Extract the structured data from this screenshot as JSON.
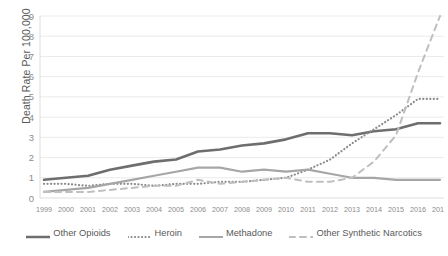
{
  "chart_data": {
    "type": "line",
    "title": "",
    "xlabel": "",
    "ylabel": "Death Rate Per 100,000",
    "ylim": [
      0,
      9
    ],
    "yticks": [
      0,
      1,
      2,
      3,
      4,
      5,
      6,
      7,
      8,
      9
    ],
    "grid": true,
    "legend_position": "bottom",
    "categories": [
      "1999",
      "2000",
      "2001",
      "2002",
      "2003",
      "2004",
      "2005",
      "2006",
      "2007",
      "2008",
      "2009",
      "2010",
      "2011",
      "2012",
      "2013",
      "2014",
      "2015",
      "2016",
      "2017"
    ],
    "series": [
      {
        "name": "Other Opioids",
        "style": "solid",
        "color": "#6e6e6e",
        "width": 2.6,
        "values": [
          0.9,
          1.0,
          1.1,
          1.4,
          1.6,
          1.8,
          1.9,
          2.3,
          2.4,
          2.6,
          2.7,
          2.9,
          3.2,
          3.2,
          3.1,
          3.3,
          3.4,
          3.7,
          3.7
        ]
      },
      {
        "name": "Heroin",
        "style": "dotted",
        "color": "#8c8c8c",
        "width": 2.2,
        "values": [
          0.7,
          0.7,
          0.6,
          0.7,
          0.7,
          0.6,
          0.7,
          0.7,
          0.8,
          0.8,
          0.9,
          1.0,
          1.4,
          1.9,
          2.7,
          3.4,
          4.1,
          4.9,
          4.9
        ]
      },
      {
        "name": "Methadone",
        "style": "solid",
        "color": "#a6a6a6",
        "width": 2.2,
        "values": [
          0.3,
          0.4,
          0.5,
          0.7,
          0.9,
          1.1,
          1.3,
          1.5,
          1.5,
          1.3,
          1.4,
          1.3,
          1.4,
          1.2,
          1.0,
          1.0,
          0.9,
          0.9,
          0.9
        ]
      },
      {
        "name": "Other Synthetic Narcotics",
        "style": "dashed",
        "color": "#bfbfbf",
        "width": 2.0,
        "values": [
          0.3,
          0.3,
          0.3,
          0.4,
          0.5,
          0.6,
          0.6,
          0.9,
          0.7,
          0.8,
          0.9,
          1.0,
          0.8,
          0.8,
          1.0,
          1.8,
          3.1,
          6.2,
          9.0
        ]
      }
    ]
  },
  "legend": {
    "items": [
      {
        "label": "Other Opioids"
      },
      {
        "label": "Heroin"
      },
      {
        "label": "Methadone"
      },
      {
        "label": "Other Synthetic Narcotics"
      }
    ]
  }
}
